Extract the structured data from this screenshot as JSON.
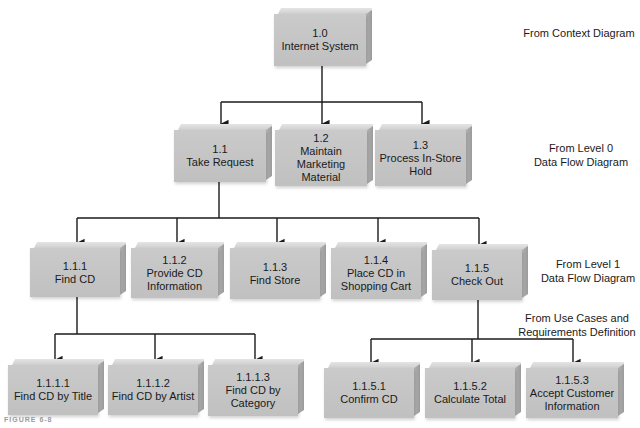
{
  "diagram": {
    "type": "hierarchy-chart",
    "levels": [
      {
        "id": "level-0",
        "annotation": [
          "From Context Diagram"
        ],
        "nodes": [
          {
            "id": "1.0",
            "number": "1.0",
            "label": [
              "Internet System"
            ]
          }
        ]
      },
      {
        "id": "level-1",
        "annotation": [
          "From Level 0",
          "Data Flow Diagram"
        ],
        "nodes": [
          {
            "id": "1.1",
            "number": "1.1",
            "label": [
              "Take Request"
            ]
          },
          {
            "id": "1.2",
            "number": "1.2",
            "label": [
              "Maintain Marketing",
              "Material"
            ]
          },
          {
            "id": "1.3",
            "number": "1.3",
            "label": [
              "Process In-Store",
              "Hold"
            ]
          }
        ]
      },
      {
        "id": "level-2",
        "annotation": [
          "From Level 1",
          "Data Flow Diagram"
        ],
        "nodes": [
          {
            "id": "1.1.1",
            "number": "1.1.1",
            "label": [
              "Find CD"
            ]
          },
          {
            "id": "1.1.2",
            "number": "1.1.2",
            "label": [
              "Provide CD",
              "Information"
            ]
          },
          {
            "id": "1.1.3",
            "number": "1.1.3",
            "label": [
              "Find Store"
            ]
          },
          {
            "id": "1.1.4",
            "number": "1.1.4",
            "label": [
              "Place CD in",
              "Shopping Cart"
            ]
          },
          {
            "id": "1.1.5",
            "number": "1.1.5",
            "label": [
              "Check Out"
            ]
          }
        ]
      },
      {
        "id": "level-3",
        "annotation": [
          "From Use Cases and",
          "Requirements Definition"
        ],
        "nodes": [
          {
            "id": "1.1.1.1",
            "number": "1.1.1.1",
            "label": [
              "Find CD by Title"
            ]
          },
          {
            "id": "1.1.1.2",
            "number": "1.1.1.2",
            "label": [
              "Find CD by Artist"
            ]
          },
          {
            "id": "1.1.1.3",
            "number": "1.1.1.3",
            "label": [
              "Find CD by",
              "Category"
            ]
          },
          {
            "id": "1.1.5.1",
            "number": "1.1.5.1",
            "label": [
              "Confirm CD"
            ]
          },
          {
            "id": "1.1.5.2",
            "number": "1.1.5.2",
            "label": [
              "Calculate Total"
            ]
          },
          {
            "id": "1.1.5.3",
            "number": "1.1.5.3",
            "label": [
              "Accept Customer",
              "Information"
            ]
          }
        ]
      }
    ],
    "edges": [
      [
        "1.0",
        "1.1"
      ],
      [
        "1.0",
        "1.2"
      ],
      [
        "1.0",
        "1.3"
      ],
      [
        "1.1",
        "1.1.1"
      ],
      [
        "1.1",
        "1.1.2"
      ],
      [
        "1.1",
        "1.1.3"
      ],
      [
        "1.1",
        "1.1.4"
      ],
      [
        "1.1",
        "1.1.5"
      ],
      [
        "1.1.1",
        "1.1.1.1"
      ],
      [
        "1.1.1",
        "1.1.1.2"
      ],
      [
        "1.1.1",
        "1.1.1.3"
      ],
      [
        "1.1.5",
        "1.1.5.1"
      ],
      [
        "1.1.5",
        "1.1.5.2"
      ],
      [
        "1.1.5",
        "1.1.5.3"
      ]
    ],
    "caption": "FIGURE 6-8",
    "colors": {
      "box_face": "#c4c4c4",
      "box_top": "#d8d8d8",
      "box_side": "#a8a8a8",
      "line": "#1a1a1a",
      "text": "#1a1a1a",
      "background": "#ffffff"
    }
  }
}
